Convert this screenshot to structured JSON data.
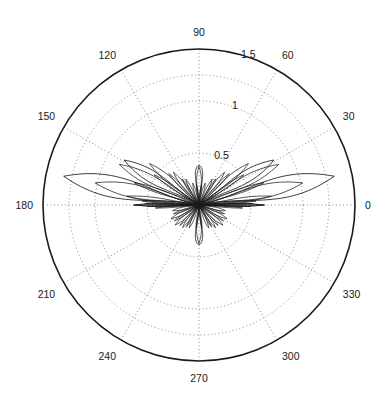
{
  "figure": {
    "kind": "polar-plot",
    "background_color": "#ffffff",
    "line_color": "#1a1a1a",
    "grid_color": "#888888",
    "center_x": 199,
    "center_y": 205,
    "outer_radius": 156
  },
  "chart_data": {
    "type": "line",
    "title": "",
    "subtitle": "",
    "xlabel": "",
    "ylabel": "",
    "projection": "polar",
    "grid": true,
    "legend_position": "none",
    "theta_direction": "counterclockwise",
    "theta_zero_location": "E",
    "angle_unit": "degrees",
    "angular_ticks": [
      0,
      30,
      60,
      90,
      120,
      150,
      180,
      210,
      240,
      270,
      300,
      330
    ],
    "angular_tick_labels": [
      "0",
      "30",
      "60",
      "90",
      "120",
      "150",
      "180",
      "210",
      "240",
      "270",
      "300",
      "330"
    ],
    "radial_ticks": [
      0.5,
      1,
      1.5
    ],
    "radial_tick_labels": [
      "0.5",
      "1",
      "1.5"
    ],
    "radial_label_angle": 75,
    "rlim": [
      0,
      1.5
    ],
    "grid_circles": [
      0.5,
      1.0,
      1.25,
      1.5
    ],
    "outer_circle_r": 1.5,
    "lobes": [
      {
        "center_deg": 0,
        "peak_r": 0.62,
        "half_width_deg": 2.0
      },
      {
        "center_deg": 180,
        "peak_r": 0.62,
        "half_width_deg": 2.0
      },
      {
        "center_deg": 12,
        "peak_r": 1.02,
        "half_width_deg": 6.5
      },
      {
        "center_deg": 168,
        "peak_r": 1.02,
        "half_width_deg": 6.5
      },
      {
        "center_deg": 27,
        "peak_r": 0.86,
        "half_width_deg": 6.0
      },
      {
        "center_deg": 153,
        "peak_r": 0.86,
        "half_width_deg": 6.0
      },
      {
        "center_deg": 40,
        "peak_r": 0.62,
        "half_width_deg": 5.0
      },
      {
        "center_deg": 140,
        "peak_r": 0.62,
        "half_width_deg": 5.0
      },
      {
        "center_deg": 52,
        "peak_r": 0.4,
        "half_width_deg": 4.5
      },
      {
        "center_deg": 128,
        "peak_r": 0.4,
        "half_width_deg": 4.5
      },
      {
        "center_deg": 63,
        "peak_r": 0.28,
        "half_width_deg": 4.0
      },
      {
        "center_deg": 117,
        "peak_r": 0.28,
        "half_width_deg": 4.0
      },
      {
        "center_deg": 74,
        "peak_r": 0.22,
        "half_width_deg": 4.0
      },
      {
        "center_deg": 106,
        "peak_r": 0.22,
        "half_width_deg": 4.0
      },
      {
        "center_deg": 90,
        "peak_r": 0.37,
        "half_width_deg": 6.5
      },
      {
        "center_deg": 348,
        "peak_r": 0.26,
        "half_width_deg": 5.0
      },
      {
        "center_deg": 192,
        "peak_r": 0.26,
        "half_width_deg": 5.0
      },
      {
        "center_deg": 334,
        "peak_r": 0.3,
        "half_width_deg": 5.0
      },
      {
        "center_deg": 206,
        "peak_r": 0.3,
        "half_width_deg": 5.0
      },
      {
        "center_deg": 320,
        "peak_r": 0.3,
        "half_width_deg": 5.0
      },
      {
        "center_deg": 220,
        "peak_r": 0.3,
        "half_width_deg": 5.0
      },
      {
        "center_deg": 306,
        "peak_r": 0.27,
        "half_width_deg": 4.5
      },
      {
        "center_deg": 234,
        "peak_r": 0.27,
        "half_width_deg": 4.5
      },
      {
        "center_deg": 293,
        "peak_r": 0.24,
        "half_width_deg": 4.5
      },
      {
        "center_deg": 247,
        "peak_r": 0.24,
        "half_width_deg": 4.5
      },
      {
        "center_deg": 270,
        "peak_r": 0.37,
        "half_width_deg": 6.5
      },
      {
        "center_deg": 7,
        "peak_r": 0.7,
        "half_width_deg": 3.0
      },
      {
        "center_deg": 173,
        "peak_r": 0.7,
        "half_width_deg": 3.0
      },
      {
        "center_deg": 19,
        "peak_r": 0.66,
        "half_width_deg": 3.2
      },
      {
        "center_deg": 161,
        "peak_r": 0.66,
        "half_width_deg": 3.2
      },
      {
        "center_deg": 34,
        "peak_r": 0.52,
        "half_width_deg": 3.0
      },
      {
        "center_deg": 146,
        "peak_r": 0.52,
        "half_width_deg": 3.0
      },
      {
        "center_deg": 46,
        "peak_r": 0.42,
        "half_width_deg": 3.0
      },
      {
        "center_deg": 134,
        "peak_r": 0.42,
        "half_width_deg": 3.0
      },
      {
        "center_deg": 57,
        "peak_r": 0.3,
        "half_width_deg": 3.0
      },
      {
        "center_deg": 123,
        "peak_r": 0.3,
        "half_width_deg": 3.0
      },
      {
        "center_deg": 83,
        "peak_r": 0.2,
        "half_width_deg": 3.0
      },
      {
        "center_deg": 97,
        "peak_r": 0.2,
        "half_width_deg": 3.0
      },
      {
        "center_deg": 341,
        "peak_r": 0.26,
        "half_width_deg": 3.0
      },
      {
        "center_deg": 199,
        "peak_r": 0.26,
        "half_width_deg": 3.0
      },
      {
        "center_deg": 327,
        "peak_r": 0.28,
        "half_width_deg": 3.0
      },
      {
        "center_deg": 213,
        "peak_r": 0.28,
        "half_width_deg": 3.0
      },
      {
        "center_deg": 313,
        "peak_r": 0.27,
        "half_width_deg": 3.0
      },
      {
        "center_deg": 227,
        "peak_r": 0.27,
        "half_width_deg": 3.0
      },
      {
        "center_deg": 300,
        "peak_r": 0.24,
        "half_width_deg": 3.0
      },
      {
        "center_deg": 240,
        "peak_r": 0.24,
        "half_width_deg": 3.0
      },
      {
        "center_deg": 263,
        "peak_r": 0.22,
        "half_width_deg": 3.0
      },
      {
        "center_deg": 277,
        "peak_r": 0.22,
        "half_width_deg": 3.0
      },
      {
        "center_deg": 1.5,
        "peak_r": 0.52,
        "half_width_deg": 1.2
      },
      {
        "center_deg": 178.5,
        "peak_r": 0.52,
        "half_width_deg": 1.2
      },
      {
        "center_deg": 358.5,
        "peak_r": 0.5,
        "half_width_deg": 1.2
      },
      {
        "center_deg": 181.5,
        "peak_r": 0.5,
        "half_width_deg": 1.2
      },
      {
        "center_deg": 4,
        "peak_r": 0.55,
        "half_width_deg": 1.4
      },
      {
        "center_deg": 176,
        "peak_r": 0.55,
        "half_width_deg": 1.4
      },
      {
        "center_deg": 356,
        "peak_r": 0.42,
        "half_width_deg": 1.4
      },
      {
        "center_deg": 184,
        "peak_r": 0.42,
        "half_width_deg": 1.4
      }
    ],
    "big_lobes": [
      {
        "center_deg": 12,
        "peak_r": 1.33,
        "half_width_deg": 8.0,
        "name": "main-lobe-right-upper"
      },
      {
        "center_deg": 168,
        "peak_r": 1.33,
        "half_width_deg": 8.0,
        "name": "main-lobe-left-upper"
      },
      {
        "center_deg": 31,
        "peak_r": 0.84,
        "half_width_deg": 7.0,
        "name": "side-lobe-right"
      },
      {
        "center_deg": 149,
        "peak_r": 0.84,
        "half_width_deg": 7.0,
        "name": "side-lobe-left"
      }
    ]
  },
  "axis": {
    "angular_labels": [
      {
        "text": "0",
        "angle_deg": 0
      },
      {
        "text": "30",
        "angle_deg": 30
      },
      {
        "text": "60",
        "angle_deg": 60
      },
      {
        "text": "90",
        "angle_deg": 90
      },
      {
        "text": "120",
        "angle_deg": 120
      },
      {
        "text": "150",
        "angle_deg": 150
      },
      {
        "text": "180",
        "angle_deg": 180
      },
      {
        "text": "210",
        "angle_deg": 210
      },
      {
        "text": "240",
        "angle_deg": 240
      },
      {
        "text": "270",
        "angle_deg": 270
      },
      {
        "text": "300",
        "angle_deg": 300
      },
      {
        "text": "330",
        "angle_deg": 330
      }
    ],
    "radial_labels": [
      {
        "text": "0.5",
        "r": 0.5
      },
      {
        "text": "1",
        "r": 1.0
      },
      {
        "text": "1.5",
        "r": 1.5
      }
    ]
  }
}
